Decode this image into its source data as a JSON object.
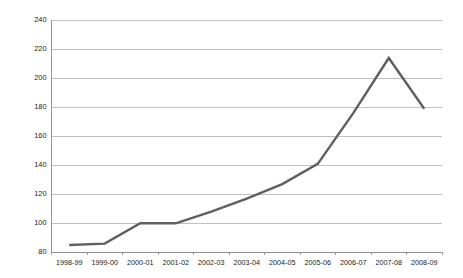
{
  "chart_data": {
    "type": "line",
    "title": "",
    "subtitle": "",
    "xlabel": "",
    "ylabel": "",
    "categories": [
      "1998-99",
      "1999-00",
      "2000-01",
      "2001-02",
      "2002-03",
      "2003-04",
      "2004-05",
      "2005-06",
      "2006-07",
      "2007-08",
      "2008-09"
    ],
    "values": [
      85,
      86,
      100,
      100,
      108,
      117,
      127,
      141,
      176,
      214,
      179
    ],
    "ylim": [
      80,
      240
    ],
    "yticks": [
      80,
      100,
      120,
      140,
      160,
      180,
      200,
      220,
      240
    ],
    "ytick_labels": [
      "80",
      "100",
      "120",
      "140",
      "160",
      "180",
      "200",
      "220",
      "240"
    ],
    "grid": {
      "horizontal": true,
      "vertical": false
    },
    "legend": {
      "visible": false,
      "position": "none",
      "entries": []
    },
    "series": [
      {
        "name": "Series 1",
        "color": "#5f5f5f",
        "values": [
          85,
          86,
          100,
          100,
          108,
          117,
          127,
          141,
          176,
          214,
          179
        ]
      }
    ],
    "annotations": []
  },
  "colors": {
    "background": "#ffffff",
    "gridline": "#b0b0b0",
    "axis": "#8a8a8a",
    "line": "#5f5f5f",
    "text": "#1a1a1a"
  }
}
